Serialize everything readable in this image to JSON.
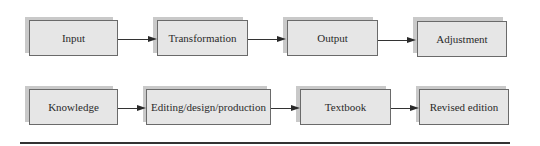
{
  "diagram": {
    "rows": [
      {
        "name": "general-process",
        "nodes": [
          "Input",
          "Transformation",
          "Output",
          "Adjustment"
        ]
      },
      {
        "name": "textbook-process",
        "nodes": [
          "Knowledge",
          "Editing/design/production",
          "Textbook",
          "Revised edition"
        ]
      }
    ],
    "edges": [
      {
        "from": "Input",
        "to": "Transformation"
      },
      {
        "from": "Transformation",
        "to": "Output"
      },
      {
        "from": "Output",
        "to": "Adjustment"
      },
      {
        "from": "Knowledge",
        "to": "Editing/design/production"
      },
      {
        "from": "Editing/design/production",
        "to": "Textbook"
      },
      {
        "from": "Textbook",
        "to": "Revised edition"
      }
    ]
  }
}
